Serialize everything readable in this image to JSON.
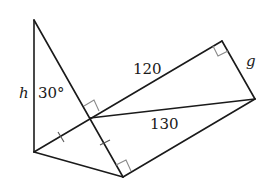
{
  "diagram": {
    "type": "geometry-figure",
    "vertices": {
      "A": [
        34,
        20
      ],
      "B": [
        34,
        152
      ],
      "C": [
        123,
        177
      ],
      "O": [
        90,
        118
      ],
      "D": [
        222,
        41
      ],
      "E": [
        255,
        99
      ]
    },
    "labels": {
      "h": "h",
      "angle": "30°",
      "side_120": "120",
      "side_130": "130",
      "g": "g"
    },
    "right_angles": [
      "at O between AC and BD",
      "at C between OC and CE",
      "at D between OD and DE"
    ],
    "congruent_marks": [
      "BO",
      "OC"
    ]
  }
}
